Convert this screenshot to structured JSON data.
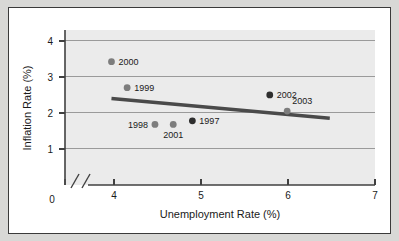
{
  "chart_data": {
    "type": "scatter",
    "title": "",
    "xlabel": "Unemployment Rate (%)",
    "ylabel": "Inflation Rate (%)",
    "xlim": [
      3.7,
      7.0
    ],
    "ylim": [
      0,
      4.3
    ],
    "xticks": [
      4,
      5,
      6,
      7
    ],
    "xtick_labels": [
      "4",
      "5",
      "6",
      "7"
    ],
    "yticks": [
      1,
      2,
      3,
      4
    ],
    "ytick_labels": [
      "1",
      "2",
      "3",
      "4"
    ],
    "origin_label": "0",
    "axis_break": true,
    "grid": true,
    "grid_axis": "y",
    "legend": "none",
    "points": [
      {
        "label": "1997",
        "x": 4.9,
        "y": 1.78,
        "label_side": "right",
        "marker": "dark"
      },
      {
        "label": "1998",
        "x": 4.47,
        "y": 1.68,
        "label_side": "left",
        "marker": "gray"
      },
      {
        "label": "1999",
        "x": 4.15,
        "y": 2.7,
        "label_side": "right",
        "marker": "gray"
      },
      {
        "label": "2000",
        "x": 3.97,
        "y": 3.42,
        "label_side": "right",
        "marker": "gray"
      },
      {
        "label": "2001",
        "x": 4.68,
        "y": 1.68,
        "label_side": "below",
        "marker": "gray"
      },
      {
        "label": "2002",
        "x": 5.79,
        "y": 2.5,
        "label_side": "right",
        "marker": "dark"
      },
      {
        "label": "2003",
        "x": 5.99,
        "y": 2.05,
        "label_side": "above-right",
        "marker": "gray"
      }
    ],
    "trendline": {
      "name": "trend-line",
      "x_start": 3.97,
      "y_start": 2.4,
      "x_end": 6.48,
      "y_end": 1.85
    }
  },
  "style": {
    "page_background": "#d8d8d6",
    "figure_background": "#ffffff",
    "figure_border": "#3a3a3a",
    "plot_background": "#ebebeb",
    "grid_color": "#9a9a9a",
    "axis_color": "#404040",
    "marker_gray": "#7d7d7d",
    "marker_dark": "#2e2e2e",
    "trendline_color": "#4a4a4a",
    "text_color": "#1a1a1a"
  }
}
